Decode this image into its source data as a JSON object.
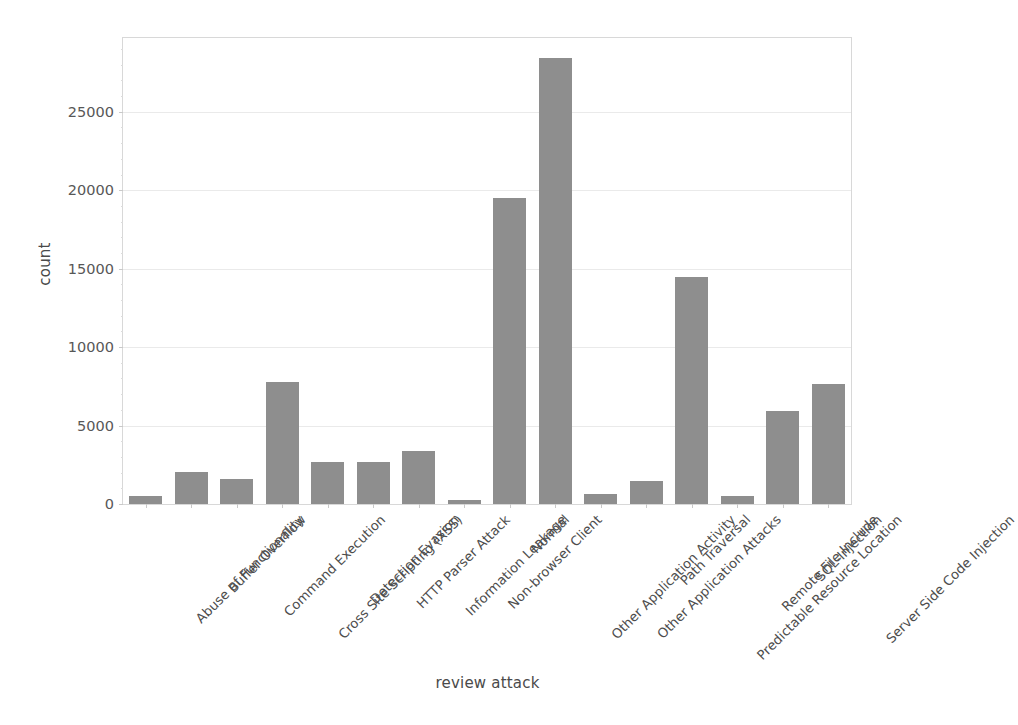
{
  "chart_data": {
    "type": "bar",
    "title": "",
    "xlabel": "review attack",
    "ylabel": "count",
    "categories": [
      "Abuse of Functionality",
      "Buffer Overflow",
      "Command Execution",
      "Cross Site Scripting (XSS)",
      "Detection Evasion",
      "HTTP Parser Attack",
      "Information Leakage",
      "Non-browser Client",
      "Normal",
      "Other Application Activity",
      "Other Application Attacks",
      "Path Traversal",
      "Predictable Resource Location",
      "Remote File Include",
      "SQL-Injection",
      "Server Side Code Injection"
    ],
    "values": [
      500,
      2050,
      1600,
      7800,
      2650,
      2650,
      3350,
      250,
      19500,
      28400,
      650,
      1450,
      14500,
      500,
      5900,
      7650
    ],
    "ylim": [
      0,
      29700
    ],
    "yticks": [
      0,
      5000,
      10000,
      15000,
      20000,
      25000
    ],
    "ytick_labels": [
      "0",
      "5000",
      "10000",
      "15000",
      "20000",
      "25000"
    ],
    "grid": true,
    "legend": "none",
    "bar_color": "#8e8e8e",
    "grid_color": "#eaeaea",
    "axis_color": "#d8d8d8",
    "text_color": "#4d4d4d"
  }
}
